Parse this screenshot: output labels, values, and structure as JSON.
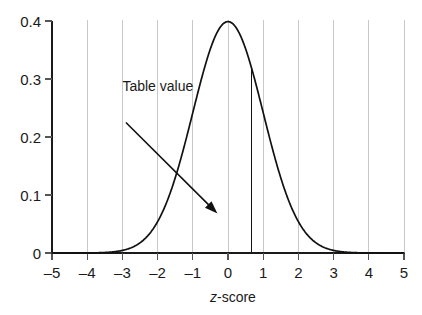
{
  "chart_data": {
    "type": "line",
    "title": "",
    "subtitle": "",
    "xlabel_italic": "z",
    "xlabel_rest": "-score",
    "xlabel": "z-score",
    "ylabel": "",
    "xlim": [
      -5,
      5
    ],
    "ylim": [
      0,
      0.4
    ],
    "grid": "vertical gridlines at every integer x tick",
    "legend": "none",
    "x_ticks": [
      "–5",
      "–4",
      "–3",
      "–2",
      "–1",
      "0",
      "1",
      "2",
      "3",
      "4",
      "5"
    ],
    "x_tick_values": [
      -5,
      -4,
      -3,
      -2,
      -1,
      0,
      1,
      2,
      3,
      4,
      5
    ],
    "y_ticks": [
      "0",
      "0.1",
      "0.2",
      "0.3",
      "0.4"
    ],
    "y_tick_values": [
      0,
      0.1,
      0.2,
      0.3,
      0.4
    ],
    "series": [
      {
        "name": "standard normal density",
        "description": "phi(z) = (1/sqrt(2*pi)) * exp(-z^2/2)",
        "x": [
          -5,
          -4.5,
          -4,
          -3.5,
          -3,
          -2.75,
          -2.5,
          -2.25,
          -2,
          -1.75,
          -1.5,
          -1.25,
          -1,
          -0.75,
          -0.5,
          -0.25,
          0,
          0.25,
          0.5,
          0.67,
          0.75,
          1,
          1.25,
          1.5,
          1.75,
          2,
          2.25,
          2.5,
          2.75,
          3,
          3.5,
          4,
          4.5,
          5
        ],
        "values": [
          0.0,
          0.0,
          0.0,
          0.001,
          0.004,
          0.009,
          0.018,
          0.032,
          0.054,
          0.086,
          0.13,
          0.183,
          0.242,
          0.301,
          0.352,
          0.387,
          0.399,
          0.387,
          0.352,
          0.319,
          0.301,
          0.242,
          0.183,
          0.13,
          0.086,
          0.054,
          0.032,
          0.018,
          0.009,
          0.004,
          0.001,
          0.0,
          0.0,
          0.0
        ]
      }
    ],
    "markers": [
      {
        "name": "table-value-boundary",
        "type": "vertical-line",
        "x": 0.67,
        "y_top": 0.319,
        "y_bottom": 0
      }
    ],
    "annotations": [
      {
        "name": "table-value",
        "text": "Table value",
        "text_x": -3.0,
        "text_y": 0.28,
        "arrow_from_x": -2.9,
        "arrow_from_y": 0.225,
        "arrow_to_x": -0.3,
        "arrow_to_y": 0.068
      }
    ],
    "colors": {
      "curve": "#111111",
      "axis": "#1a1a1a",
      "grid": "#c9c9c9",
      "vertical_line": "#111111",
      "annotation": "#111111",
      "background": "#ffffff"
    }
  }
}
